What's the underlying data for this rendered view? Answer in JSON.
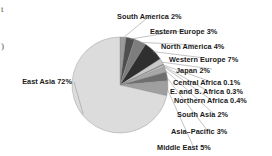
{
  "chart_data": {
    "type": "pie",
    "title": "",
    "xlabel": "",
    "ylabel": "",
    "legend_position": "callout-labels",
    "grid": false,
    "units": "percent",
    "categories": [
      "South America",
      "Eastern Europe",
      "North America",
      "Western Europe",
      "Japan",
      "Central Africa",
      "E. and S. Africa",
      "Northern Africa",
      "South Asia",
      "Asia-Pacific",
      "Middle East",
      "East Asia"
    ],
    "values": [
      2,
      3,
      4,
      7,
      2,
      0.1,
      0.3,
      0.4,
      2,
      3,
      5,
      72
    ],
    "value_labels": [
      "2%",
      "3%",
      "4%",
      "7%",
      "2%",
      "0.1%",
      "0.3%",
      "0.4%",
      "2%",
      "3%",
      "5%",
      "72%"
    ],
    "slice_colors": [
      "#9a9a9a",
      "#4e4e4e",
      "#7d7d7d",
      "#2f2f2f",
      "#c9c9c9",
      "#5a5a5a",
      "#8d8d8d",
      "#f2f2f2",
      "#a8a8a8",
      "#6e6e6e",
      "#9f9f9f",
      "#dcdcdc"
    ],
    "slice_stroke": "#8a8a8a"
  },
  "labels": [
    {
      "name": "south-america",
      "text": "South America  2%"
    },
    {
      "name": "eastern-europe",
      "text": "Eastern Europe  3%"
    },
    {
      "name": "north-america",
      "text": "North America  4%"
    },
    {
      "name": "western-europe",
      "text": "Western Europe  7%"
    },
    {
      "name": "japan",
      "text": "Japan  2%"
    },
    {
      "name": "central-africa",
      "text": "Central Africa  0.1%"
    },
    {
      "name": "e-and-s-africa",
      "text": "E. and S. Africa  0.3%"
    },
    {
      "name": "northern-africa",
      "text": "Northern Africa  0.4%"
    },
    {
      "name": "south-asia",
      "text": "South Asia  2%"
    },
    {
      "name": "asia-pacific",
      "text": "Asia–Pacific  3%"
    },
    {
      "name": "middle-east",
      "text": "Middle East  5%"
    },
    {
      "name": "east-asia",
      "text": "East Asia  72%"
    }
  ],
  "edge_fragments": {
    "top_left": "t",
    "mid_left": ")"
  }
}
